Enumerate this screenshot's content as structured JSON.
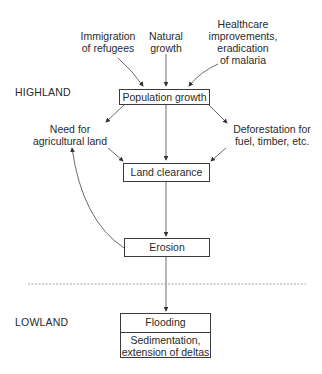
{
  "diagram": {
    "zones": {
      "highland": "HIGHLAND",
      "lowland": "LOWLAND"
    },
    "inputs": {
      "immigration": [
        "Immigration",
        "of refugees"
      ],
      "natural": [
        "Natural",
        "growth"
      ],
      "healthcare": [
        "Healthcare",
        "improvements,",
        "eradication",
        "of malaria"
      ]
    },
    "nodes": {
      "population_growth": "Population growth",
      "need_for_land": [
        "Need for",
        "agricultural land"
      ],
      "deforestation": [
        "Deforestation for",
        "fuel, timber, etc."
      ],
      "land_clearance": "Land clearance",
      "erosion": "Erosion",
      "flooding": "Flooding",
      "sedimentation": [
        "Sedimentation,",
        "extension of deltas"
      ]
    },
    "edges": [
      {
        "from": "Immigration of refugees",
        "to": "Population growth"
      },
      {
        "from": "Natural growth",
        "to": "Population growth"
      },
      {
        "from": "Healthcare improvements, eradication of malaria",
        "to": "Population growth"
      },
      {
        "from": "Population growth",
        "to": "Need for agricultural land"
      },
      {
        "from": "Population growth",
        "to": "Land clearance"
      },
      {
        "from": "Population growth",
        "to": "Deforestation for fuel, timber, etc."
      },
      {
        "from": "Need for agricultural land",
        "to": "Land clearance"
      },
      {
        "from": "Deforestation for fuel, timber, etc.",
        "to": "Land clearance"
      },
      {
        "from": "Land clearance",
        "to": "Erosion"
      },
      {
        "from": "Erosion",
        "to": "Need for agricultural land"
      },
      {
        "from": "Erosion",
        "to": "Flooding"
      }
    ],
    "caption": "Chapter illustration caption (cut off)"
  }
}
